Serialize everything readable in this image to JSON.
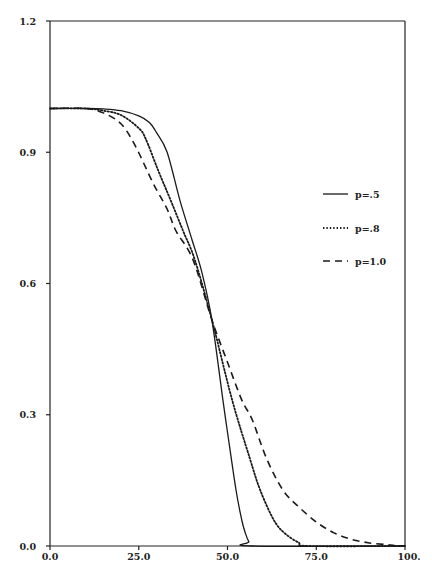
{
  "chart_data": {
    "type": "line",
    "title": "",
    "xlabel": "",
    "ylabel": "",
    "xlim": [
      0,
      100
    ],
    "ylim": [
      0,
      1.2
    ],
    "grid": false,
    "legend_position": "right-center inside",
    "x_ticks": [
      "0.0",
      "25.0",
      "50.0",
      "75.0",
      "100."
    ],
    "x_tick_values": [
      0,
      25,
      50,
      75,
      100
    ],
    "y_ticks": [
      "0.0",
      "0.3",
      "0.6",
      "0.9",
      "1.2"
    ],
    "y_tick_values": [
      0,
      0.3,
      0.6,
      0.9,
      1.2
    ],
    "series": [
      {
        "name": "p=.5",
        "style": "solid",
        "x": [
          0,
          10,
          15,
          20,
          25,
          28,
          30,
          33,
          36.6,
          40,
          42.8,
          45.6,
          48.7,
          50,
          52.4,
          54,
          55,
          56,
          57,
          100
        ],
        "y": [
          1.0,
          1.0,
          0.999,
          0.995,
          0.983,
          0.968,
          0.945,
          0.9,
          0.79,
          0.7,
          0.625,
          0.517,
          0.334,
          0.26,
          0.128,
          0.06,
          0.03,
          0.01,
          0.0,
          0.0
        ]
      },
      {
        "name": "p=.8",
        "style": "dotted",
        "x": [
          0,
          10,
          15,
          20,
          25,
          27,
          30.4,
          34,
          37.5,
          40.8,
          45.6,
          51.3,
          56.3,
          59.2,
          63,
          66,
          70,
          73,
          100
        ],
        "y": [
          1.0,
          1.0,
          0.995,
          0.985,
          0.955,
          0.93,
          0.86,
          0.79,
          0.72,
          0.654,
          0.517,
          0.334,
          0.2,
          0.128,
          0.06,
          0.03,
          0.008,
          0.0,
          0.0
        ]
      },
      {
        "name": "p=1.0",
        "style": "dashed",
        "x": [
          0,
          10,
          15,
          20,
          24,
          29,
          33,
          35.5,
          40.3,
          45.6,
          50,
          54,
          57,
          61,
          65.6,
          70,
          75,
          80,
          85,
          90,
          95,
          98,
          100
        ],
        "y": [
          1.0,
          1.0,
          0.99,
          0.965,
          0.915,
          0.83,
          0.77,
          0.72,
          0.654,
          0.517,
          0.42,
          0.334,
          0.288,
          0.2,
          0.128,
          0.09,
          0.055,
          0.03,
          0.015,
          0.007,
          0.003,
          0.0,
          0.0
        ]
      }
    ]
  },
  "legend": {
    "items": [
      {
        "label": "p=.5",
        "style": "solid"
      },
      {
        "label": "p=.8",
        "style": "dotted"
      },
      {
        "label": "p=1.0",
        "style": "dashed"
      }
    ]
  },
  "colors": {
    "line": "#1a1a1a",
    "background": "#ffffff"
  }
}
